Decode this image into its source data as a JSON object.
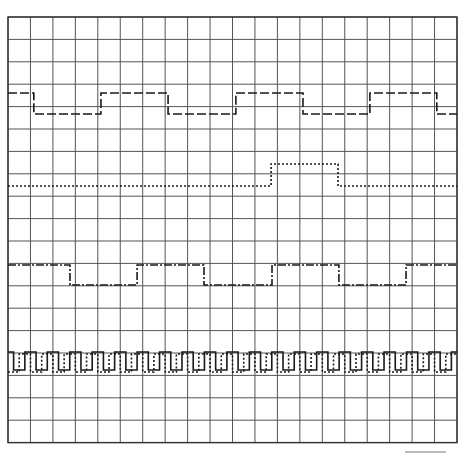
{
  "diagram": {
    "type": "timing-diagram",
    "grid": {
      "origin_x": 8,
      "origin_y": 17,
      "columns": 20,
      "rows": 19,
      "cell_width": 22.45,
      "cell_height": 22.4,
      "line_color": "#555555"
    },
    "signals": [
      {
        "name": "signal-1",
        "style": "dashed",
        "dash": "9,3",
        "high_y": 93,
        "low_y": 114,
        "initial": "high",
        "transitions_x_cells": [
          1.15,
          4.14,
          7.13,
          10.15,
          13.14,
          16.12,
          19.1
        ]
      },
      {
        "name": "signal-2",
        "style": "dotted",
        "dash": "2,2",
        "high_y": 164,
        "low_y": 186,
        "initial": "low",
        "transitions_x_cells": [
          11.72,
          14.7
        ]
      },
      {
        "name": "signal-3",
        "style": "dash-dot",
        "dash": "8,2,2,2",
        "high_y": 265,
        "low_y": 285,
        "initial": "high",
        "transitions_x_cells": [
          2.76,
          5.75,
          8.73,
          11.76,
          14.74,
          17.73
        ]
      },
      {
        "name": "clock-solid",
        "style": "solid",
        "dash": "",
        "high_y": 352,
        "low_y": 370,
        "initial": "high",
        "period_cells": 1.0,
        "phase_cells": 0.25
      },
      {
        "name": "clock-dotted",
        "style": "dotted",
        "dash": "2,2",
        "high_y": 354,
        "low_y": 372,
        "initial": "low",
        "period_cells": 1.0,
        "phase_cells": 0.5
      }
    ]
  }
}
